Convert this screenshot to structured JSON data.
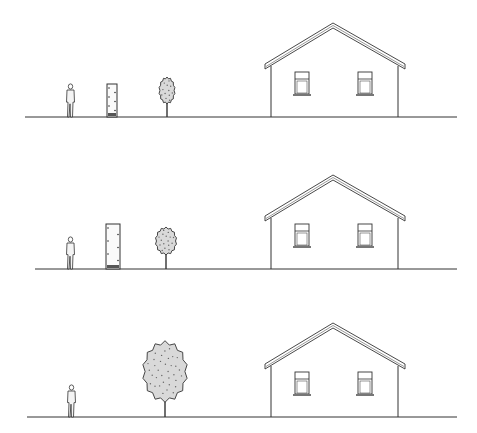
{
  "diagram": {
    "type": "architectural-elevation-sequence",
    "stroke_color": "#333333",
    "foliage_color": "#d9d9d9",
    "panels": [
      {
        "id": "panel-1",
        "ground": {
          "y": 117,
          "x1": 25,
          "x2": 457
        },
        "person": {
          "x": 67,
          "top": 84
        },
        "column": {
          "x": 107,
          "w": 10,
          "top": 84
        },
        "tree": {
          "cx": 167,
          "crown_top": 78,
          "crown_bottom": 103,
          "crown_w": 15
        },
        "house": {
          "peak_y": 23,
          "eave_y": 64,
          "window_top": 72
        }
      },
      {
        "id": "panel-2",
        "ground": {
          "y": 269,
          "x1": 35,
          "x2": 457
        },
        "person": {
          "x": 67,
          "top": 237
        },
        "column": {
          "x": 106,
          "w": 14,
          "top": 224
        },
        "tree": {
          "cx": 166,
          "crown_top": 228,
          "crown_bottom": 254,
          "crown_w": 20
        },
        "house": {
          "peak_y": 175,
          "eave_y": 216,
          "window_top": 224
        }
      },
      {
        "id": "panel-3",
        "ground": {
          "y": 417,
          "x1": 27,
          "x2": 457
        },
        "person": {
          "x": 68,
          "top": 385
        },
        "column": null,
        "tree": {
          "cx": 165,
          "crown_top": 343,
          "crown_bottom": 400,
          "crown_w": 42
        },
        "house": {
          "peak_y": 323,
          "eave_y": 364,
          "window_top": 372
        }
      }
    ]
  }
}
